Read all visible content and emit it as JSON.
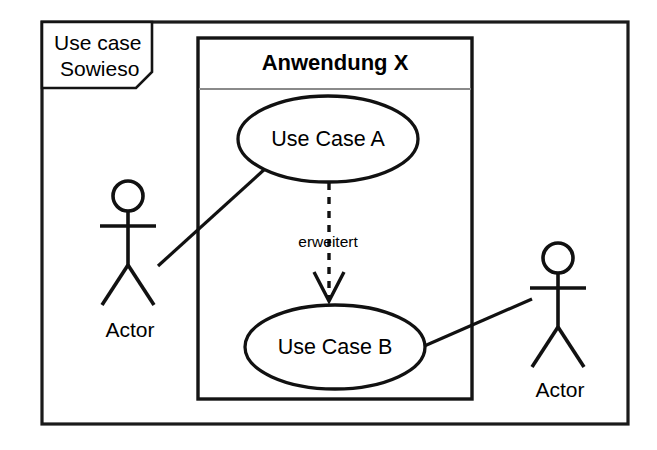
{
  "diagram": {
    "kind": "uml-use-case-diagram",
    "frame": {
      "label_line1": "Use case",
      "label_line2": "Sowieso"
    },
    "system": {
      "title": "Anwendung X"
    },
    "use_cases": [
      {
        "id": "a",
        "label": "Use Case A"
      },
      {
        "id": "b",
        "label": "Use Case B"
      }
    ],
    "actors": [
      {
        "id": "left",
        "label": "Actor"
      },
      {
        "id": "right",
        "label": "Actor"
      }
    ],
    "relationships": [
      {
        "id": "extend",
        "label": "erweitert",
        "from": "Use Case A",
        "to": "Use Case B",
        "style": "dashed-arrow"
      },
      {
        "id": "assoc-left",
        "label": "",
        "from": "Actor",
        "to": "Use Case A",
        "style": "solid-line"
      },
      {
        "id": "assoc-right",
        "label": "",
        "from": "Use Case B",
        "to": "Actor",
        "style": "solid-line"
      }
    ],
    "colors": {
      "stroke": "#111111",
      "divider": "#8a8a8a",
      "background": "#ffffff"
    }
  }
}
